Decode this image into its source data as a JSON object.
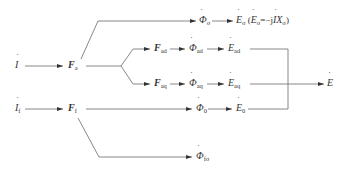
{
  "diagram": {
    "title": "",
    "nodes": {
      "I": {
        "sym": "I",
        "sub": ""
      },
      "If": {
        "sym": "I",
        "sub": "f"
      },
      "Fa": {
        "sym": "F",
        "sub": "a"
      },
      "Ff": {
        "sym": "F",
        "sub": "f"
      },
      "Fad": {
        "sym": "F",
        "sub": "ad"
      },
      "Faq": {
        "sym": "F",
        "sub": "aq"
      },
      "PhiSigma": {
        "sym": "Φ",
        "sub": "σ"
      },
      "PhiAd": {
        "sym": "Φ",
        "sub": "ad"
      },
      "PhiAq": {
        "sym": "Φ",
        "sub": "aq"
      },
      "Phi0": {
        "sym": "Φ",
        "sub": "0"
      },
      "PhiFsigma": {
        "sym": "Φ",
        "sub": "fσ"
      },
      "ESigma": {
        "sym": "E",
        "sub": "σ"
      },
      "EAd": {
        "sym": "E",
        "sub": "ad"
      },
      "EAq": {
        "sym": "E",
        "sub": "aq"
      },
      "E0": {
        "sym": "E",
        "sub": "0"
      },
      "E": {
        "sym": "E",
        "sub": ""
      }
    },
    "annotation": {
      "open": "(",
      "lhs_sym": "E",
      "lhs_sub": "σ",
      "eq": "=−j",
      "rhs_sym": "I",
      "rhs_var": "X",
      "rhs_sub": "σ",
      "close": ")"
    },
    "edges": [
      [
        "I",
        "Fa"
      ],
      [
        "If",
        "Ff"
      ],
      [
        "Fa",
        "PhiSigma"
      ],
      [
        "Fa",
        "Fad"
      ],
      [
        "Fa",
        "Faq"
      ],
      [
        "Fad",
        "PhiAd"
      ],
      [
        "Faq",
        "PhiAq"
      ],
      [
        "PhiSigma",
        "ESigma"
      ],
      [
        "PhiAd",
        "EAd"
      ],
      [
        "PhiAq",
        "EAq"
      ],
      [
        "Ff",
        "Phi0"
      ],
      [
        "Phi0",
        "E0"
      ],
      [
        "Ff",
        "PhiFsigma"
      ],
      [
        "EAd",
        "E"
      ],
      [
        "EAq",
        "E"
      ],
      [
        "E0",
        "E"
      ]
    ],
    "colors": {
      "line": "#6a6a6a",
      "text": "#333333",
      "background": "#ffffff"
    }
  }
}
